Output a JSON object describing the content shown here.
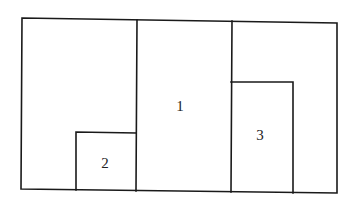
{
  "diagram": {
    "type": "rectangle-partition",
    "stroke_color": "#1a1a1a",
    "background": "#ffffff",
    "outer": {
      "x1": 22,
      "y1": 19,
      "x2": 337,
      "y2": 191
    },
    "regions": [
      {
        "id": "1",
        "label": "1",
        "label_pos": {
          "x": 180,
          "y": 106
        }
      },
      {
        "id": "2",
        "label": "2",
        "label_pos": {
          "x": 105,
          "y": 163
        }
      },
      {
        "id": "3",
        "label": "3",
        "label_pos": {
          "x": 260,
          "y": 135
        }
      }
    ]
  }
}
